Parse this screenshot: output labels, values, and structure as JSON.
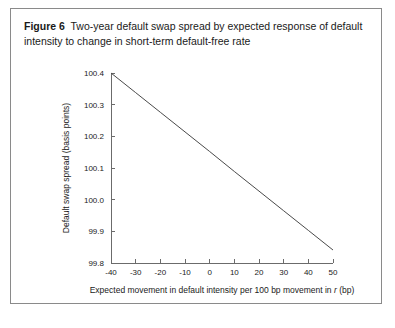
{
  "figure": {
    "label": "Figure 6",
    "caption": "Two-year default swap spread by expected response of default intensity to change in short-term default-free rate"
  },
  "chart_data": {
    "type": "line",
    "title": "Two-year default swap spread by expected response of default intensity to change in short-term default-free rate",
    "xlabel_prefix": "Expected movement in default intensity per 100 bp movement in ",
    "xlabel_italic": "r",
    "xlabel_suffix": " (bp)",
    "ylabel": "Default swap spread (basis points)",
    "xlim": [
      -40,
      50
    ],
    "ylim": [
      99.8,
      100.4
    ],
    "xticks": [
      -40,
      -30,
      -20,
      -10,
      0,
      10,
      20,
      30,
      40,
      50
    ],
    "xticklabels": [
      "-40",
      "-30",
      "-20",
      "-10",
      "0",
      "10",
      "20",
      "30",
      "40",
      "50"
    ],
    "yticks": [
      99.8,
      99.9,
      100.0,
      100.1,
      100.2,
      100.3,
      100.4
    ],
    "yticklabels": [
      "99.8",
      "99.9",
      "100.0",
      "100.1",
      "100.2",
      "100.3",
      "100.4"
    ],
    "grid": false,
    "legend": false,
    "series": [
      {
        "name": "Two-year default swap spread",
        "x": [
          -40,
          -30,
          -20,
          -10,
          0,
          10,
          20,
          30,
          40,
          50
        ],
        "values": [
          100.4,
          100.338,
          100.276,
          100.214,
          100.152,
          100.089,
          100.027,
          99.965,
          99.903,
          99.841
        ]
      }
    ],
    "line_color": "#4a4a4a",
    "axis_color": "#6b6b6b"
  }
}
